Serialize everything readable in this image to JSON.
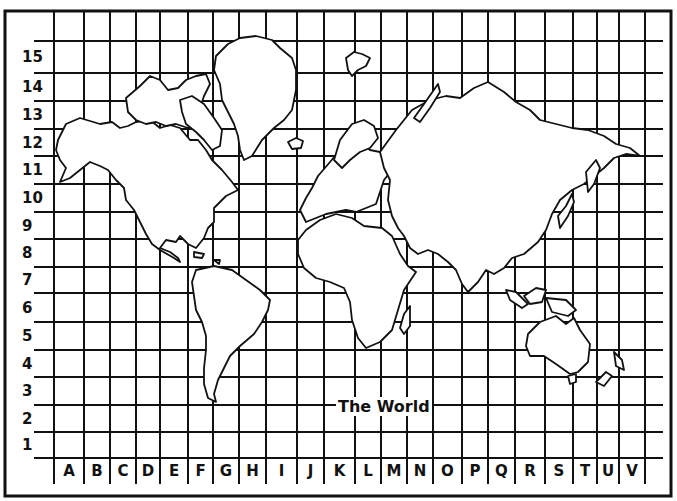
{
  "map": {
    "title": "The World",
    "row_labels": [
      "15",
      "14",
      "13",
      "12",
      "11",
      "10",
      "9",
      "8",
      "7",
      "6",
      "5",
      "4",
      "3",
      "2",
      "1"
    ],
    "column_labels": [
      "A",
      "B",
      "C",
      "D",
      "E",
      "F",
      "G",
      "H",
      "I",
      "J",
      "K",
      "L",
      "M",
      "N",
      "O",
      "P",
      "Q",
      "R",
      "S",
      "T",
      "U",
      "V"
    ],
    "line_color": "#111111",
    "background_color": "#ffffff",
    "grid": {
      "vertical_lines_x": [
        54,
        84,
        110,
        136,
        160,
        188,
        213,
        239,
        266,
        297,
        324,
        355,
        381,
        407,
        433,
        462,
        488,
        515,
        545,
        573,
        597,
        619,
        645
      ],
      "horizontal_lines_y": [
        41,
        73,
        101,
        129,
        156,
        184,
        212,
        239,
        267,
        293,
        322,
        350,
        377,
        405,
        432,
        458
      ]
    },
    "continents": [
      "North America",
      "Greenland",
      "South America",
      "Europe",
      "Africa",
      "Asia",
      "Australia",
      "New Zealand",
      "Antarctica-free"
    ]
  }
}
